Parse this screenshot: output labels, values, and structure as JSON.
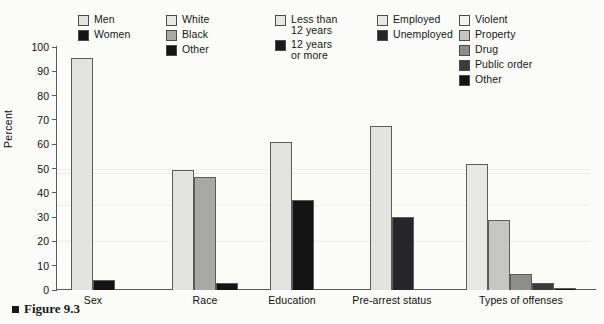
{
  "caption": {
    "marker": "square-marker",
    "text": "Figure 9.3"
  },
  "chart_data": {
    "type": "bar",
    "title": "",
    "xlabel": "",
    "ylabel": "Percent",
    "ylim": [
      0,
      100
    ],
    "yticks": [
      0,
      10,
      20,
      30,
      40,
      50,
      60,
      70,
      80,
      90,
      100
    ],
    "grid": true,
    "legend_position": "top",
    "categories": [
      "Sex",
      "Race",
      "Education",
      "Pre-arrest status",
      "Types of offenses"
    ],
    "groups": [
      {
        "category": "Sex",
        "series": [
          {
            "name": "Men",
            "value": 95.5,
            "color": "#e3e3e1"
          },
          {
            "name": "Women",
            "value": 4.0,
            "color": "#141414"
          }
        ]
      },
      {
        "category": "Race",
        "series": [
          {
            "name": "White",
            "value": 49.5,
            "color": "#e3e3e1"
          },
          {
            "name": "Black",
            "value": 46.5,
            "color": "#a8a8a6"
          },
          {
            "name": "Other",
            "value": 3.0,
            "color": "#141414"
          }
        ]
      },
      {
        "category": "Education",
        "series": [
          {
            "name": "Less than 12 years",
            "value": 61.0,
            "color": "#e3e3e1"
          },
          {
            "name": "12 years or more",
            "value": 37.0,
            "color": "#141414"
          }
        ]
      },
      {
        "category": "Pre-arrest status",
        "series": [
          {
            "name": "Employed",
            "value": 67.5,
            "color": "#e3e3e1"
          },
          {
            "name": "Unemployed",
            "value": 30.0,
            "color": "#26262a"
          }
        ]
      },
      {
        "category": "Types of offenses",
        "series": [
          {
            "name": "Violent",
            "value": 52.0,
            "color": "#e8e8e6"
          },
          {
            "name": "Property",
            "value": 29.0,
            "color": "#c6c6c4"
          },
          {
            "name": "Drug",
            "value": 6.5,
            "color": "#8d8d8b"
          },
          {
            "name": "Public order",
            "value": 3.0,
            "color": "#3b3b3d"
          },
          {
            "name": "Other",
            "value": 1.0,
            "color": "#141414"
          }
        ]
      }
    ]
  },
  "legends": [
    {
      "id": "sex",
      "items": [
        {
          "label": "Men",
          "color": "#e3e3e1"
        },
        {
          "label": "Women",
          "color": "#141414"
        }
      ]
    },
    {
      "id": "race",
      "items": [
        {
          "label": "White",
          "color": "#e8e8e6"
        },
        {
          "label": "Black",
          "color": "#a8a8a6"
        },
        {
          "label": "Other",
          "color": "#141414"
        }
      ]
    },
    {
      "id": "education",
      "items": [
        {
          "label": "Less than\n12 years",
          "color": "#e8e8e6"
        },
        {
          "label": "12 years\nor more",
          "color": "#1b1b1d"
        }
      ]
    },
    {
      "id": "prearrest",
      "items": [
        {
          "label": "Employed",
          "color": "#e8e8e6"
        },
        {
          "label": "Unemployed",
          "color": "#26262a"
        }
      ]
    },
    {
      "id": "offenses",
      "items": [
        {
          "label": "Violent",
          "color": "#f2f2f0"
        },
        {
          "label": "Property",
          "color": "#c6c6c4"
        },
        {
          "label": "Drug",
          "color": "#8d8d8b"
        },
        {
          "label": "Public order",
          "color": "#3b3b3d"
        },
        {
          "label": "Other",
          "color": "#141414"
        }
      ]
    }
  ]
}
